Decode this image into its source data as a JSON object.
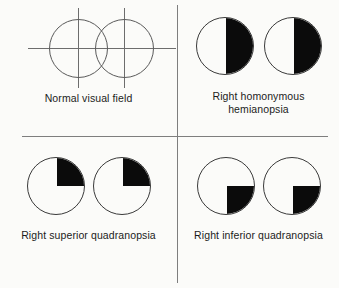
{
  "figure": {
    "background_color": "#fbfbf9",
    "line_color": "#7e7e7e",
    "fill_color": "#0b0b0b",
    "outline_color": "#3a3a3a"
  },
  "panels": [
    {
      "id": "normal",
      "caption": "Normal visual field",
      "eyes": [
        {
          "label": "left-eye",
          "defect": "none"
        },
        {
          "label": "right-eye",
          "defect": "none"
        }
      ],
      "crosshairs": true,
      "overlapping": true
    },
    {
      "id": "hemianopsia",
      "caption": "Right homonymous\nhemianopsia",
      "eyes": [
        {
          "label": "left-eye",
          "defect": "right-half"
        },
        {
          "label": "right-eye",
          "defect": "right-half"
        }
      ],
      "crosshairs": false,
      "overlapping": false
    },
    {
      "id": "superior",
      "caption": "Right superior quadranopsia",
      "eyes": [
        {
          "label": "left-eye",
          "defect": "upper-right-quadrant"
        },
        {
          "label": "right-eye",
          "defect": "upper-right-quadrant"
        }
      ],
      "crosshairs": false,
      "overlapping": false
    },
    {
      "id": "inferior",
      "caption": "Right inferior quadranopsia",
      "eyes": [
        {
          "label": "left-eye",
          "defect": "lower-right-quadrant"
        },
        {
          "label": "right-eye",
          "defect": "lower-right-quadrant"
        }
      ],
      "crosshairs": false,
      "overlapping": false
    }
  ]
}
